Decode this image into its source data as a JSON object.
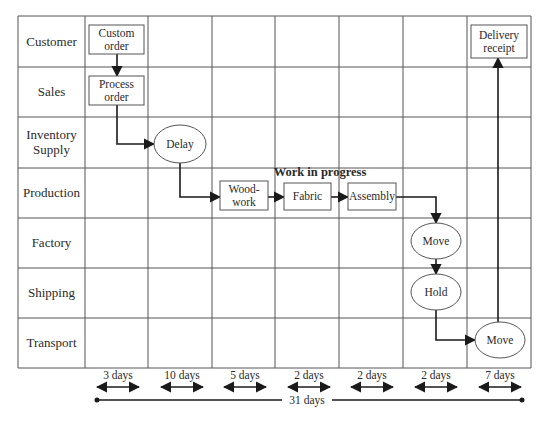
{
  "diagram": {
    "type": "swimlane-value-stream-map",
    "colors": {
      "grid": "#555555",
      "line": "#1a1a1a",
      "box": "#555555",
      "text": "#2a2a2a"
    },
    "grid": {
      "left": 18,
      "top": 16,
      "right": 531,
      "bottom": 368,
      "column_x": [
        18,
        85,
        148,
        212,
        275,
        339,
        403,
        467,
        531
      ],
      "row_y": [
        16,
        67,
        117,
        168,
        218,
        268,
        318,
        368
      ]
    },
    "lanes": [
      {
        "label": "Customer"
      },
      {
        "label": "Sales"
      },
      {
        "label": "Inventory Supply",
        "lines": [
          "Inventory",
          "Supply"
        ]
      },
      {
        "label": "Production"
      },
      {
        "label": "Factory"
      },
      {
        "label": "Shipping"
      },
      {
        "label": "Transport"
      }
    ],
    "nodes": [
      {
        "id": "custom-order",
        "shape": "rect",
        "lines": [
          "Custom",
          "order"
        ],
        "x": 89,
        "y": 25,
        "w": 55,
        "h": 29
      },
      {
        "id": "process-order",
        "shape": "rect",
        "lines": [
          "Process",
          "order"
        ],
        "x": 89,
        "y": 76,
        "w": 55,
        "h": 29
      },
      {
        "id": "delay",
        "shape": "ellipse",
        "lines": [
          "Delay"
        ],
        "cx": 180,
        "cy": 144,
        "rx": 26,
        "ry": 19
      },
      {
        "id": "wood-work",
        "shape": "rect",
        "lines": [
          "Wood-",
          "work"
        ],
        "x": 220,
        "y": 181,
        "w": 48,
        "h": 29
      },
      {
        "id": "fabric",
        "shape": "rect",
        "lines": [
          "Fabric"
        ],
        "x": 284,
        "y": 183,
        "w": 47,
        "h": 27
      },
      {
        "id": "assembly",
        "shape": "rect",
        "lines": [
          "Assembly"
        ],
        "x": 348,
        "y": 183,
        "w": 48,
        "h": 27
      },
      {
        "id": "move-factory",
        "shape": "ellipse",
        "lines": [
          "Move"
        ],
        "cx": 436,
        "cy": 241,
        "rx": 25,
        "ry": 18
      },
      {
        "id": "hold",
        "shape": "ellipse",
        "lines": [
          "Hold"
        ],
        "cx": 436,
        "cy": 292,
        "rx": 25,
        "ry": 18
      },
      {
        "id": "move-transport",
        "shape": "ellipse",
        "lines": [
          "Move"
        ],
        "cx": 500,
        "cy": 340,
        "rx": 25,
        "ry": 18
      },
      {
        "id": "delivery-receipt",
        "shape": "rect",
        "lines": [
          "Delivery",
          "receipt"
        ],
        "x": 471,
        "y": 25,
        "w": 56,
        "h": 33
      }
    ],
    "group_label": {
      "text": "Work in progress",
      "x": 320,
      "y": 176
    },
    "edges": [
      {
        "from": "custom-order",
        "to": "process-order",
        "points": [
          [
            117,
            54
          ],
          [
            117,
            76
          ]
        ]
      },
      {
        "from": "process-order",
        "to": "delay",
        "points": [
          [
            117,
            105
          ],
          [
            117,
            144
          ],
          [
            154,
            144
          ]
        ]
      },
      {
        "from": "delay",
        "to": "wood-work",
        "points": [
          [
            180,
            163
          ],
          [
            180,
            197
          ],
          [
            220,
            197
          ]
        ]
      },
      {
        "from": "wood-work",
        "to": "fabric",
        "points": [
          [
            268,
            197
          ],
          [
            284,
            197
          ]
        ]
      },
      {
        "from": "fabric",
        "to": "assembly",
        "points": [
          [
            331,
            197
          ],
          [
            348,
            197
          ]
        ]
      },
      {
        "from": "assembly",
        "to": "move-factory",
        "points": [
          [
            396,
            197
          ],
          [
            436,
            197
          ],
          [
            436,
            223
          ]
        ]
      },
      {
        "from": "move-factory",
        "to": "hold",
        "points": [
          [
            436,
            259
          ],
          [
            436,
            274
          ]
        ]
      },
      {
        "from": "hold",
        "to": "move-transport",
        "points": [
          [
            436,
            310
          ],
          [
            436,
            340
          ],
          [
            475,
            340
          ]
        ]
      },
      {
        "from": "move-transport",
        "to": "delivery-receipt",
        "points": [
          [
            498,
            322
          ],
          [
            498,
            58
          ]
        ]
      }
    ],
    "timeline": {
      "segments": [
        {
          "label": "3 days",
          "x1": 96,
          "x2": 140
        },
        {
          "label": "10 days",
          "x1": 160,
          "x2": 204
        },
        {
          "label": "5 days",
          "x1": 223,
          "x2": 267
        },
        {
          "label": "2 days",
          "x1": 287,
          "x2": 331
        },
        {
          "label": "2 days",
          "x1": 350,
          "x2": 394
        },
        {
          "label": "2 days",
          "x1": 414,
          "x2": 458
        },
        {
          "label": "7 days",
          "x1": 478,
          "x2": 522
        }
      ],
      "segment_arrow_y": 387,
      "segment_label_y": 381,
      "total": {
        "label": "31 days",
        "x1": 97,
        "x2": 522,
        "y": 400,
        "gap_x1": 282,
        "gap_x2": 332,
        "label_x": 307
      }
    }
  }
}
